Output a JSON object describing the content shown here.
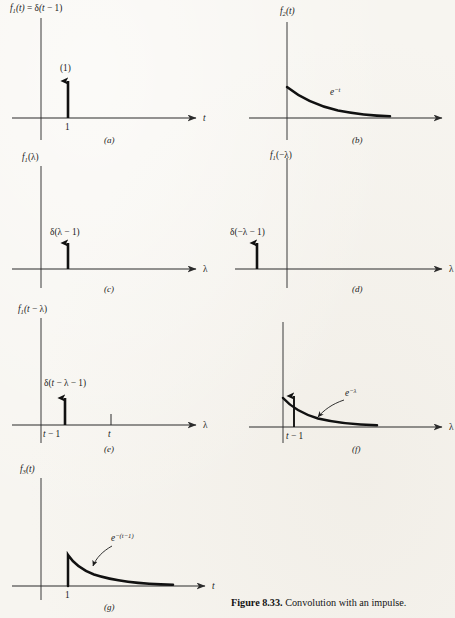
{
  "figure": {
    "caption_bold": "Figure 8.33.",
    "caption_text": "Convolution with an impulse.",
    "background_color": "#f7f5f0",
    "ink_color": "#111111"
  },
  "panels": [
    {
      "letter": "(a)",
      "y_axis_label": "f1(t) = δ(t − 1)",
      "y_axis_label_parts": {
        "f": "f",
        "sub": "1",
        "rest": "(t) = δ(t − 1)"
      },
      "x_axis_label": "t",
      "annotations": [
        {
          "name": "impulse-weight",
          "text": "(1)"
        },
        {
          "name": "x-tick-label",
          "text": "1"
        }
      ],
      "content": "unit impulse of weight 1 located at t = 1"
    },
    {
      "letter": "(b)",
      "y_axis_label_parts": {
        "f": "f",
        "sub": "2",
        "rest": "(t)"
      },
      "x_axis_label": "",
      "annotations": [
        {
          "name": "curve-label",
          "text": "e−t",
          "base": "e",
          "exponent": "−t"
        }
      ],
      "content": "decaying exponential e^(-t) starting at the vertical axis"
    },
    {
      "letter": "(c)",
      "y_axis_label_parts": {
        "f": "f",
        "sub": "1",
        "rest": "(λ)"
      },
      "x_axis_label": "λ",
      "annotations": [
        {
          "name": "impulse-label",
          "text": "δ(λ − 1)"
        }
      ],
      "content": "impulse at lambda = 1"
    },
    {
      "letter": "(d)",
      "y_axis_label_parts": {
        "f": "f",
        "sub": "1",
        "rest": "(−λ)"
      },
      "x_axis_label": "λ",
      "annotations": [
        {
          "name": "impulse-label",
          "text": "δ(−λ − 1)"
        }
      ],
      "content": "impulse at lambda = -1, left of the origin"
    },
    {
      "letter": "(e)",
      "y_axis_label_parts": {
        "f": "f",
        "sub": "1",
        "rest": "(t − λ)"
      },
      "x_axis_label": "λ",
      "annotations": [
        {
          "name": "impulse-label",
          "text": "δ(t − λ − 1)"
        },
        {
          "name": "x-tick-label-shifted",
          "text": "t − 1"
        },
        {
          "name": "x-tick-label-t",
          "text": "t"
        }
      ],
      "content": "impulse at lambda = t - 1 with a tick mark at lambda = t"
    },
    {
      "letter": "(f)",
      "y_axis_label_parts": {
        "f": "",
        "sub": "",
        "rest": ""
      },
      "x_axis_label": "λ",
      "annotations": [
        {
          "name": "curve-label",
          "text": "e−λ",
          "base": "e",
          "exponent": "−λ"
        },
        {
          "name": "x-tick-label-shifted",
          "text": "t − 1"
        }
      ],
      "content": "impulse at lambda = t - 1 superimposed on the e^(-lambda) curve"
    },
    {
      "letter": "(g)",
      "y_axis_label_parts": {
        "f": "f",
        "sub": "3",
        "rest": "(t)"
      },
      "x_axis_label": "t",
      "annotations": [
        {
          "name": "curve-label",
          "text": "e−(t−1)",
          "base": "e",
          "exponent": "−(t − 1)"
        },
        {
          "name": "x-tick-label",
          "text": "1"
        }
      ],
      "content": "exponential e^-(t-1) switched on at t = 1"
    }
  ]
}
